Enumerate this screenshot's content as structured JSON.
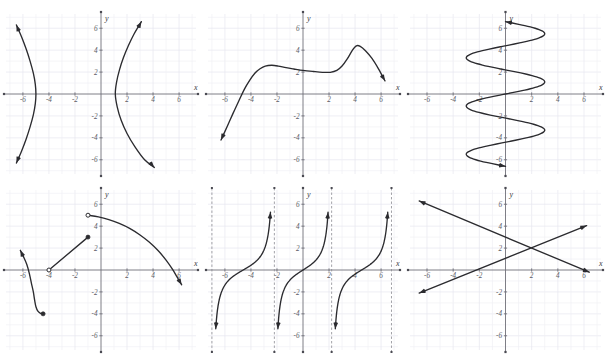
{
  "page": {
    "background_color": "#ffffff",
    "cut_header_text": "",
    "grid_color": "#e7e7ef",
    "axis_color": "#6f6f78",
    "curve_color": "#2b2b2f",
    "asymptote_color": "#8a8a92"
  },
  "axes_common": {
    "x_label": "x",
    "y_label": "y",
    "x_ticks": [
      -6,
      -4,
      -2,
      2,
      4,
      6
    ],
    "y_ticks": [
      -6,
      -4,
      -2,
      2,
      4,
      6
    ],
    "x_tick_labels": [
      "-6",
      "-4",
      "-2",
      "2",
      "4",
      "6"
    ],
    "y_tick_labels": [
      "-6",
      "-4",
      "-2",
      "2",
      "4",
      "6"
    ],
    "xlim": [
      -7.3,
      7.3
    ],
    "ylim": [
      -7.3,
      7.3
    ],
    "grid": true,
    "grid_step": 1,
    "major_grid_step": 2
  },
  "chart_data": [
    {
      "id": "graph-1",
      "index": 1,
      "position": "top-left",
      "type": "line",
      "title": "",
      "xlabel": "x",
      "ylabel": "y",
      "xlim": [
        -7.3,
        7.3
      ],
      "ylim": [
        -7.3,
        7.3
      ],
      "grid": true,
      "legend": "none",
      "description": "Horizontal hyperbola: two opposing branches opening left and right, vertices near (-5,0) and (1,0)",
      "series": [
        {
          "name": "left-branch",
          "style": "curve-with-arrows",
          "arrow_start": true,
          "arrow_end": true,
          "points": [
            [
              -6.5,
              6.3
            ],
            [
              -6.1,
              5.2
            ],
            [
              -5.75,
              4.1
            ],
            [
              -5.45,
              3.0
            ],
            [
              -5.2,
              1.9
            ],
            [
              -5.05,
              0.9
            ],
            [
              -5.0,
              0.0
            ],
            [
              -5.05,
              -0.9
            ],
            [
              -5.2,
              -1.9
            ],
            [
              -5.45,
              -3.0
            ],
            [
              -5.75,
              -4.1
            ],
            [
              -6.1,
              -5.2
            ],
            [
              -6.5,
              -6.3
            ]
          ]
        },
        {
          "name": "right-branch",
          "style": "curve-with-arrows",
          "arrow_start": true,
          "arrow_end": true,
          "points": [
            [
              3.1,
              6.6
            ],
            [
              2.55,
              5.5
            ],
            [
              2.1,
              4.4
            ],
            [
              1.72,
              3.3
            ],
            [
              1.42,
              2.2
            ],
            [
              1.2,
              1.1
            ],
            [
              1.1,
              0.0
            ],
            [
              1.25,
              -1.2
            ],
            [
              1.55,
              -2.4
            ],
            [
              2.0,
              -3.6
            ],
            [
              2.6,
              -4.8
            ],
            [
              3.35,
              -6.0
            ],
            [
              4.1,
              -6.7
            ]
          ]
        }
      ]
    },
    {
      "id": "graph-2",
      "index": 2,
      "position": "top-center",
      "type": "line",
      "title": "",
      "xlabel": "x",
      "ylabel": "y",
      "xlim": [
        -7.3,
        7.3
      ],
      "ylim": [
        -7.3,
        7.3
      ],
      "grid": true,
      "legend": "none",
      "description": "Quartic-like curve rising steeply from lower-left, local max near (-2.8, 2.6), local min near (2, 2), peak near (4, 4.4), then falling to the right",
      "series": [
        {
          "name": "polynomial",
          "style": "curve-with-arrows",
          "arrow_start": true,
          "arrow_end": true,
          "points": [
            [
              -6.3,
              -4.2
            ],
            [
              -5.8,
              -2.9
            ],
            [
              -5.35,
              -1.7
            ],
            [
              -4.9,
              -0.55
            ],
            [
              -4.5,
              0.45
            ],
            [
              -4.1,
              1.25
            ],
            [
              -3.7,
              1.9
            ],
            [
              -3.3,
              2.3
            ],
            [
              -2.9,
              2.55
            ],
            [
              -2.4,
              2.62
            ],
            [
              -1.9,
              2.55
            ],
            [
              -1.3,
              2.4
            ],
            [
              -0.7,
              2.28
            ],
            [
              0.0,
              2.15
            ],
            [
              0.8,
              2.05
            ],
            [
              1.5,
              1.98
            ],
            [
              2.1,
              1.98
            ],
            [
              2.6,
              2.15
            ],
            [
              3.0,
              2.55
            ],
            [
              3.4,
              3.2
            ],
            [
              3.8,
              4.0
            ],
            [
              4.1,
              4.4
            ],
            [
              4.4,
              4.35
            ],
            [
              4.8,
              3.95
            ],
            [
              5.3,
              3.25
            ],
            [
              5.8,
              2.3
            ],
            [
              6.3,
              1.2
            ]
          ]
        }
      ]
    },
    {
      "id": "graph-3",
      "index": 3,
      "position": "top-right",
      "type": "line",
      "title": "",
      "xlabel": "x",
      "ylabel": "y",
      "xlim": [
        -7.3,
        7.3
      ],
      "ylim": [
        -7.3,
        7.3
      ],
      "grid": true,
      "legend": "none",
      "description": "Sideways sinusoid: x oscillates between about -3 and 3 as y runs from -6.6 to 6.6; fails the vertical line test",
      "series": [
        {
          "name": "sideways-sine",
          "style": "curve-with-arrows",
          "arrow_start": true,
          "arrow_end": true,
          "orientation": "x-as-function-of-y",
          "amplitude": 3,
          "period_in_y": 4.4,
          "y_range": [
            -6.6,
            6.6
          ]
        }
      ]
    },
    {
      "id": "graph-4",
      "index": 4,
      "position": "bottom-left",
      "type": "line",
      "title": "",
      "xlabel": "x",
      "ylabel": "y",
      "xlim": [
        -7.3,
        7.3
      ],
      "ylim": [
        -7.3,
        7.3
      ],
      "grid": true,
      "legend": "none",
      "description": "Piecewise function: decreasing curve ending at closed point (-5,-4), line segment from open point (-4,0) to closed point (-1,3), and a downward parabola-like arc from open point (-1,5) to the right",
      "series": [
        {
          "name": "left-decreasing-curve",
          "style": "curve-with-arrows",
          "arrow_start": true,
          "arrow_end": false,
          "points": [
            [
              -6.2,
              1.8
            ],
            [
              -5.95,
              1.2
            ],
            [
              -5.7,
              0.5
            ],
            [
              -5.5,
              -0.35
            ],
            [
              -5.35,
              -1.2
            ],
            [
              -5.2,
              -2.0
            ],
            [
              -5.1,
              -2.75
            ],
            [
              -5.0,
              -3.35
            ],
            [
              -4.85,
              -3.75
            ],
            [
              -4.65,
              -3.95
            ],
            [
              -4.45,
              -4.0
            ]
          ]
        },
        {
          "name": "middle-segment",
          "style": "segment",
          "points": [
            [
              -4.0,
              0.0
            ],
            [
              -1.0,
              3.0
            ]
          ]
        },
        {
          "name": "right-arc",
          "style": "curve-with-arrows",
          "arrow_start": false,
          "arrow_end": true,
          "points": [
            [
              -1.0,
              5.0
            ],
            [
              -0.2,
              4.85
            ],
            [
              0.6,
              4.6
            ],
            [
              1.4,
              4.25
            ],
            [
              2.2,
              3.8
            ],
            [
              3.0,
              3.2
            ],
            [
              3.7,
              2.55
            ],
            [
              4.4,
              1.75
            ],
            [
              5.0,
              0.9
            ],
            [
              5.5,
              0.05
            ],
            [
              5.9,
              -0.75
            ],
            [
              6.2,
              -1.35
            ]
          ]
        }
      ],
      "markers": [
        {
          "type": "filled",
          "x": -4.45,
          "y": -4.0
        },
        {
          "type": "open",
          "x": -4.0,
          "y": 0.0
        },
        {
          "type": "filled",
          "x": -1.0,
          "y": 3.0
        },
        {
          "type": "open",
          "x": -1.0,
          "y": 5.0
        }
      ]
    },
    {
      "id": "graph-5",
      "index": 5,
      "position": "bottom-center",
      "type": "line",
      "title": "",
      "xlabel": "x",
      "ylabel": "y",
      "xlim": [
        -7.3,
        7.3
      ],
      "ylim": [
        -7.3,
        7.3
      ],
      "grid": true,
      "legend": "none",
      "description": "Tangent-like periodic function with vertical dashed asymptotes at x = -7, -2.2, 2.2 and 6.8; three increasing branches",
      "asymptotes": [
        -7.0,
        -2.2,
        2.2,
        6.8
      ],
      "asymptote_style": "dashed-vertical",
      "series": [
        {
          "name": "branch-left",
          "style": "tangent-branch",
          "center": -4.6,
          "half_period": 2.4
        },
        {
          "name": "branch-middle",
          "style": "tangent-branch",
          "center": 0.0,
          "half_period": 2.2
        },
        {
          "name": "branch-right",
          "style": "tangent-branch",
          "center": 4.5,
          "half_period": 2.3
        }
      ]
    },
    {
      "id": "graph-6",
      "index": 6,
      "position": "bottom-right",
      "type": "line",
      "title": "",
      "xlabel": "x",
      "ylabel": "y",
      "xlim": [
        -7.3,
        7.3
      ],
      "ylim": [
        -7.3,
        7.3
      ],
      "grid": true,
      "legend": "none",
      "description": "Two intersecting straight lines with arrowheads on both ends, crossing near (2, 2)",
      "series": [
        {
          "name": "decreasing-line",
          "style": "segment-with-arrows",
          "arrow_start": true,
          "arrow_end": true,
          "slope": -0.5,
          "intercept": 3.0,
          "points": [
            [
              -6.6,
              6.3
            ],
            [
              6.4,
              -0.2
            ]
          ]
        },
        {
          "name": "increasing-line",
          "style": "segment-with-arrows",
          "arrow_start": true,
          "arrow_end": true,
          "slope": 0.48,
          "intercept": 1.1,
          "points": [
            [
              -6.6,
              -2.1
            ],
            [
              6.2,
              4.05
            ]
          ]
        }
      ]
    }
  ]
}
